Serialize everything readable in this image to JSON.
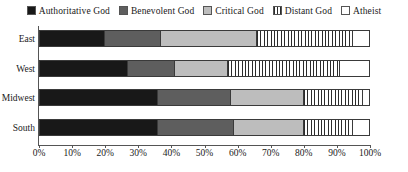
{
  "chart_data": {
    "type": "bar",
    "orientation": "horizontal",
    "stacked": true,
    "normalized_percent": true,
    "title": "",
    "xlabel": "",
    "ylabel": "",
    "xlim": [
      0,
      100
    ],
    "grid": false,
    "legend_position": "top-center",
    "categories": [
      "East",
      "West",
      "Midwest",
      "South"
    ],
    "tick_labels": [
      "0%",
      "10%",
      "20%",
      "30%",
      "40%",
      "50%",
      "60%",
      "70%",
      "80%",
      "90%",
      "100%"
    ],
    "tick_values": [
      0,
      10,
      20,
      30,
      40,
      50,
      60,
      70,
      80,
      90,
      100
    ],
    "series": [
      {
        "name": "Authoritative God",
        "fill": "solid-dark",
        "color": "#181818",
        "values": [
          20,
          27,
          36,
          36
        ]
      },
      {
        "name": "Benevolent God",
        "fill": "solid-medium-gray",
        "color": "#5e5e5e",
        "values": [
          17,
          14,
          22,
          23
        ]
      },
      {
        "name": "Critical God",
        "fill": "solid-light-gray",
        "color": "#bdbdbd",
        "values": [
          29,
          16,
          22,
          21
        ]
      },
      {
        "name": "Distant God",
        "fill": "vertical-stripes",
        "color": "#2b2b2b",
        "values": [
          29,
          34,
          18,
          15
        ]
      },
      {
        "name": "Atheist",
        "fill": "empty-white",
        "color": "#ffffff",
        "values": [
          5,
          9,
          2,
          5
        ]
      }
    ]
  },
  "legend": {
    "items": [
      {
        "label": "Authoritative God",
        "swatch": "swatch-authoritative-god"
      },
      {
        "label": "Benevolent God",
        "swatch": "swatch-benevolent-god"
      },
      {
        "label": "Critical God",
        "swatch": "swatch-critical-god"
      },
      {
        "label": "Distant God",
        "swatch": "swatch-distant-god"
      },
      {
        "label": "Atheist",
        "swatch": "swatch-atheist"
      }
    ]
  },
  "caption": ""
}
